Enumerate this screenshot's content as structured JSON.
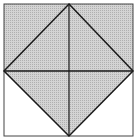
{
  "diagram": {
    "colors": {
      "shade": "#c8c8c8",
      "line": "#1a1a1a",
      "background": "#ffffff"
    },
    "points": {
      "top": [
        69,
        4
      ],
      "left": [
        4,
        71
      ],
      "right": [
        133,
        71
      ],
      "bottom": [
        69,
        136
      ]
    }
  }
}
